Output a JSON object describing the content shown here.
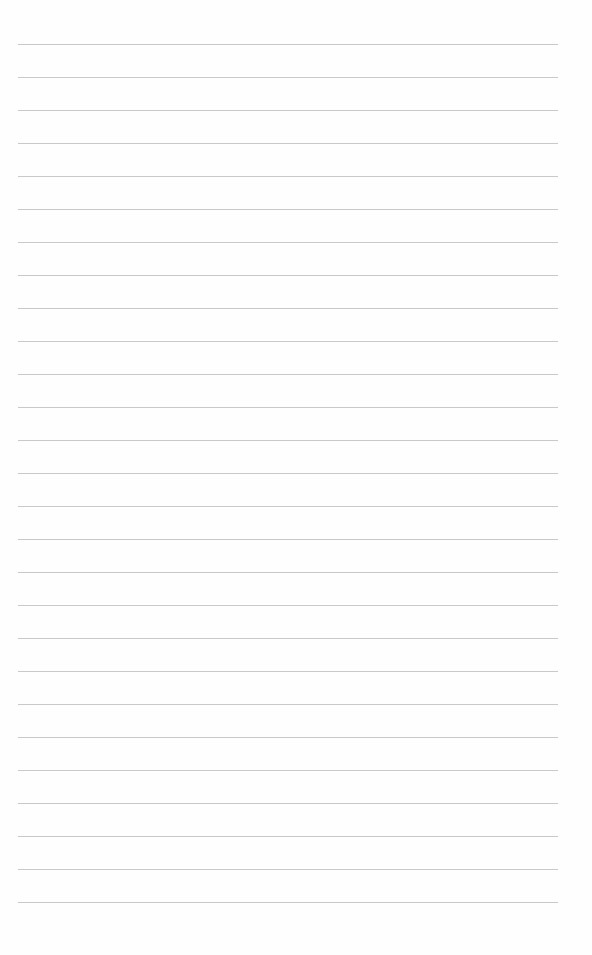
{
  "page": {
    "type": "lined-paper",
    "background": "#fefefe",
    "line_color": "#c9c9c9",
    "line_count": 27,
    "first_line_y": 44,
    "line_spacing": 33,
    "line_left": 18,
    "line_right": 558,
    "text": ""
  }
}
